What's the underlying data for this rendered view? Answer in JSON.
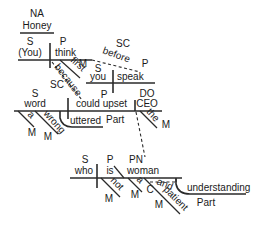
{
  "diagram": {
    "type": "sentence-diagram (Reed-Kellogg)",
    "colors": {
      "line": "#2a2a2a",
      "text": "#1a1a1a",
      "background": "#ffffff"
    },
    "nominative_address": {
      "role": "NA",
      "word": "Honey"
    },
    "main_clause": {
      "subject": {
        "role": "S",
        "word": "(You)"
      },
      "predicate": {
        "role": "P",
        "word": "think"
      },
      "modifier_first": {
        "role": "M",
        "word": "first"
      }
    },
    "clause_before": {
      "role": "SC",
      "connector": "before",
      "subject": {
        "role": "S",
        "word": "you"
      },
      "predicate": {
        "role": "P",
        "word": "speak"
      }
    },
    "clause_because": {
      "role": "SC",
      "connector": "because",
      "subject": {
        "role": "S",
        "word": "word"
      },
      "predicate": {
        "role": "P",
        "word": "could upset"
      },
      "direct_object": {
        "role": "DO",
        "word": "CEO"
      },
      "modifiers": [
        {
          "role": "M",
          "word": "a"
        },
        {
          "role": "M",
          "word": "wrong"
        },
        {
          "role": "M",
          "word": "the"
        }
      ],
      "participle": {
        "role": "Part",
        "word": "uttered"
      }
    },
    "relative_clause": {
      "subject": {
        "role": "S",
        "word": "who"
      },
      "predicate": {
        "role": "P",
        "word": "is"
      },
      "predicate_nominative": {
        "role": "PN",
        "word": "woman"
      },
      "modifiers": [
        {
          "role": "M",
          "word": "not"
        },
        {
          "role": "M",
          "word": "a"
        },
        {
          "role": "M",
          "word": "patient"
        }
      ],
      "conjunction": {
        "role": "C",
        "word": "and"
      },
      "participle": {
        "role": "Part",
        "word": "understanding"
      }
    }
  }
}
